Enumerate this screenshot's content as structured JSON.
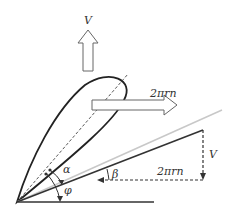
{
  "diagram": {
    "labels": {
      "v_top": "V",
      "two_pi_rn_top": "2πrn",
      "alpha": "α",
      "beta": "β",
      "phi": "φ",
      "two_pi_rn_bottom": "2πrn",
      "v_right": "V"
    },
    "colors": {
      "ink": "#222222",
      "gray_line": "#c8c8c8",
      "arrow_outline": "#666666"
    }
  }
}
